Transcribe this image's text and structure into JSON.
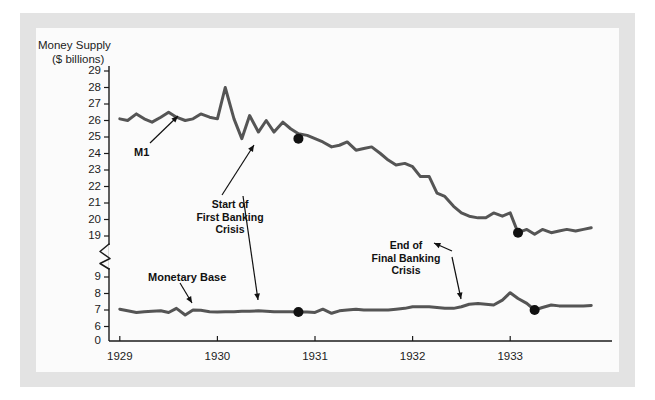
{
  "chart_data": {
    "type": "line",
    "title": "",
    "ylabel": "Money Supply ($ billions)",
    "ylabel_line1": "Money Supply",
    "ylabel_line2": "($ billions)",
    "xlabel": "",
    "yticks_upper": [
      29,
      28,
      27,
      26,
      25,
      24,
      23,
      22,
      21,
      20,
      19
    ],
    "yticks_lower": [
      9,
      8,
      7,
      6
    ],
    "origin_label": "0",
    "axis_break": true,
    "xticks": [
      1929,
      1930,
      1931,
      1932,
      1933
    ],
    "xtick_labels": [
      "1929",
      "1930",
      "1931",
      "1932",
      "1933"
    ],
    "xlim": [
      1928.92,
      1933.92
    ],
    "grid": false,
    "legend": "none",
    "series": [
      {
        "name": "M1",
        "color": "#555555",
        "x": [
          1929.0,
          1929.08,
          1929.17,
          1929.25,
          1929.33,
          1929.42,
          1929.5,
          1929.58,
          1929.67,
          1929.75,
          1929.83,
          1929.92,
          1930.0,
          1930.08,
          1930.17,
          1930.25,
          1930.33,
          1930.42,
          1930.5,
          1930.58,
          1930.67,
          1930.75,
          1930.83,
          1930.92,
          1931.0,
          1931.08,
          1931.17,
          1931.25,
          1931.33,
          1931.42,
          1931.5,
          1931.58,
          1931.67,
          1931.75,
          1931.83,
          1931.92,
          1932.0,
          1932.08,
          1932.17,
          1932.25,
          1932.33,
          1932.42,
          1932.5,
          1932.58,
          1932.67,
          1932.75,
          1932.83,
          1932.92,
          1933.0,
          1933.08,
          1933.17,
          1933.25,
          1933.33,
          1933.42,
          1933.5,
          1933.58,
          1933.67,
          1933.75,
          1933.83
        ],
        "values": [
          26.1,
          26.0,
          26.4,
          26.1,
          25.9,
          26.2,
          26.5,
          26.2,
          26.0,
          26.1,
          26.4,
          26.2,
          26.1,
          28.0,
          26.1,
          24.9,
          26.3,
          25.3,
          26.0,
          25.3,
          25.9,
          25.5,
          25.2,
          25.1,
          24.9,
          24.7,
          24.4,
          24.5,
          24.7,
          24.2,
          24.3,
          24.4,
          24.0,
          23.6,
          23.3,
          23.4,
          23.2,
          22.6,
          22.6,
          21.6,
          21.4,
          20.8,
          20.4,
          20.2,
          20.1,
          20.1,
          20.4,
          20.2,
          20.4,
          19.2,
          19.4,
          19.1,
          19.4,
          19.2,
          19.3,
          19.4,
          19.3,
          19.4,
          19.5
        ]
      },
      {
        "name": "Monetary Base",
        "color": "#555555",
        "x": [
          1929.0,
          1929.08,
          1929.17,
          1929.25,
          1929.33,
          1929.42,
          1929.5,
          1929.58,
          1929.67,
          1929.75,
          1929.83,
          1929.92,
          1930.0,
          1930.08,
          1930.17,
          1930.25,
          1930.33,
          1930.42,
          1930.5,
          1930.58,
          1930.67,
          1930.75,
          1930.83,
          1930.92,
          1931.0,
          1931.08,
          1931.17,
          1931.25,
          1931.33,
          1931.42,
          1931.5,
          1931.58,
          1931.67,
          1931.75,
          1931.83,
          1931.92,
          1932.0,
          1932.08,
          1932.17,
          1932.25,
          1932.33,
          1932.42,
          1932.5,
          1932.58,
          1932.67,
          1932.75,
          1932.83,
          1932.92,
          1933.0,
          1933.08,
          1933.17,
          1933.25,
          1933.33,
          1933.42,
          1933.5,
          1933.58,
          1933.67,
          1933.75,
          1933.83
        ],
        "values": [
          7.05,
          6.95,
          6.85,
          6.9,
          6.92,
          6.95,
          6.85,
          7.1,
          6.7,
          7.0,
          6.98,
          6.9,
          6.88,
          6.9,
          6.9,
          6.92,
          6.93,
          6.95,
          6.93,
          6.9,
          6.9,
          6.9,
          6.88,
          6.88,
          6.85,
          7.05,
          6.8,
          6.95,
          7.0,
          7.05,
          7.0,
          7.0,
          7.0,
          7.0,
          7.05,
          7.1,
          7.2,
          7.2,
          7.2,
          7.15,
          7.1,
          7.1,
          7.2,
          7.35,
          7.4,
          7.35,
          7.3,
          7.6,
          8.05,
          7.7,
          7.4,
          7.0,
          7.15,
          7.3,
          7.25,
          7.25,
          7.25,
          7.25,
          7.28
        ]
      }
    ],
    "markers": [
      {
        "label": "Start of First Banking Crisis (M1)",
        "series": "M1",
        "x": 1930.83,
        "y": 24.9
      },
      {
        "label": "Start of First Banking Crisis (Monetary Base)",
        "series": "Monetary Base",
        "x": 1930.83,
        "y": 6.88
      },
      {
        "label": "End of Final Banking Crisis (M1)",
        "series": "M1",
        "x": 1933.08,
        "y": 19.2
      },
      {
        "label": "End of Final Banking Crisis (Monetary Base)",
        "series": "Monetary Base",
        "x": 1933.25,
        "y": 7.0
      }
    ],
    "annotations": [
      {
        "name": "m1-label",
        "text": "M1"
      },
      {
        "name": "start-crisis-label",
        "lines": [
          "Start of",
          "First Banking",
          "Crisis"
        ]
      },
      {
        "name": "end-crisis-label",
        "lines": [
          "End of",
          "Final Banking",
          "Crisis"
        ]
      },
      {
        "name": "monetary-base-label",
        "text": "Monetary Base"
      }
    ]
  },
  "annotations": {
    "m1": "M1",
    "start_crisis_l1": "Start of",
    "start_crisis_l2": "First Banking",
    "start_crisis_l3": "Crisis",
    "end_crisis_l1": "End of",
    "end_crisis_l2": "Final Banking",
    "end_crisis_l3": "Crisis",
    "monetary_base": "Monetary Base"
  },
  "colors": {
    "line": "#555555",
    "axis": "#1b1b1b",
    "frame": "#e3e3e3",
    "panel": "#fbfbfb",
    "marker": "#111111"
  }
}
